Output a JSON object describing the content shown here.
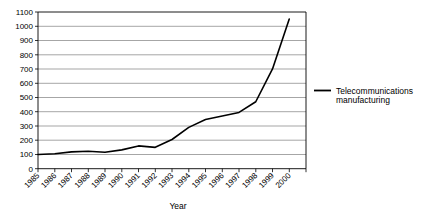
{
  "chart_data": {
    "type": "line",
    "title": "",
    "subtitle": "",
    "xlabel": "Year",
    "ylabel": "",
    "grid": "horizontal",
    "legend_position": "right",
    "xlim": [
      "1985",
      "2000"
    ],
    "ylim": [
      0,
      1100
    ],
    "ytick_step": 100,
    "categories": [
      "1985",
      "1986",
      "1987",
      "1988",
      "1989",
      "1990",
      "1991",
      "1992",
      "1993",
      "1994",
      "1995",
      "1996",
      "1997",
      "1998",
      "1999",
      "2000"
    ],
    "series": [
      {
        "name": "Telecommunications manufacturing",
        "color": "#000000",
        "values": [
          100,
          105,
          118,
          122,
          115,
          132,
          160,
          150,
          205,
          290,
          345,
          370,
          395,
          470,
          700,
          1050
        ]
      }
    ],
    "ytick_labels": [
      "1100",
      "1000",
      "900",
      "800",
      "700",
      "600",
      "500",
      "400",
      "300",
      "200",
      "100",
      "0"
    ],
    "xtick_labels": [
      "1985",
      "1986",
      "1987",
      "1988",
      "1989",
      "1990",
      "1991",
      "1992",
      "1993",
      "1994",
      "1995",
      "1996",
      "1997",
      "1998",
      "1999",
      "2000"
    ],
    "annotations": []
  },
  "axes": {
    "x_axis_title": "Year",
    "y_axis_title": ""
  },
  "legend": {
    "entries": [
      {
        "label": "Telecommunications manufacturing",
        "marker": "line-marker",
        "color": "#000000"
      }
    ],
    "line1": "Telecommunications",
    "line2": "manufacturing"
  },
  "colors": {
    "series": "#000000",
    "grid": "#7f7f7f",
    "axis": "#000000",
    "background": "#ffffff"
  }
}
